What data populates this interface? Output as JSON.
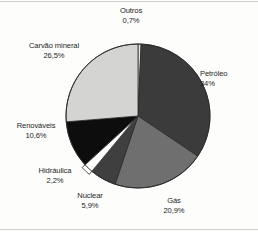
{
  "chart_data": {
    "type": "pie",
    "title": "",
    "subtitle": "",
    "xlabel": "",
    "ylabel": "",
    "legend_position": "none",
    "grid": false,
    "labels_show_percent": true,
    "start_angle_deg": 0,
    "direction": "clockwise",
    "categories": [
      "Outros",
      "Petróleo",
      "Gás",
      "Nuclear",
      "Hidráulica",
      "Renováveis",
      "Carvão mineral"
    ],
    "values": [
      0.7,
      34.0,
      20.9,
      5.9,
      2.2,
      10.6,
      26.5
    ],
    "value_labels": [
      "0,7%",
      "34%",
      "20,9%",
      "5,9%",
      "2,2%",
      "10,6%",
      "26,5%"
    ],
    "colors": [
      "#e8e8e6",
      "#3b3b3b",
      "#6f6f6f",
      "#3f3f3f",
      "#fdfdfc",
      "#0d0d0d",
      "#d4d4d2"
    ],
    "exploded": [
      false,
      false,
      false,
      false,
      true,
      false,
      false
    ],
    "slices": [
      {
        "name": "Outros",
        "value": 0.7,
        "value_label": "0,7%",
        "color": "#e8e8e6"
      },
      {
        "name": "Petróleo",
        "value": 34.0,
        "value_label": "34%",
        "color": "#3b3b3b"
      },
      {
        "name": "Gás",
        "value": 20.9,
        "value_label": "20,9%",
        "color": "#6f6f6f"
      },
      {
        "name": "Nuclear",
        "value": 5.9,
        "value_label": "5,9%",
        "color": "#3f3f3f"
      },
      {
        "name": "Hidráulica",
        "value": 2.2,
        "value_label": "2,2%",
        "color": "#fdfdfc"
      },
      {
        "name": "Renováveis",
        "value": 10.6,
        "value_label": "10,6%",
        "color": "#0d0d0d"
      },
      {
        "name": "Carvão mineral",
        "value": 26.5,
        "value_label": "26,5%",
        "color": "#d4d4d2"
      }
    ]
  },
  "labels": {
    "outros": {
      "name": "Outros",
      "value": "0,7%"
    },
    "petroleo": {
      "name": "Petróleo",
      "value": "34%"
    },
    "gas": {
      "name": "Gás",
      "value": "20,9%"
    },
    "nuclear": {
      "name": "Nuclear",
      "value": "5,9%"
    },
    "hidraulica": {
      "name": "Hidráulica",
      "value": "2,2%"
    },
    "renovaveis": {
      "name": "Renováveis",
      "value": "10,6%"
    },
    "carvao_mineral": {
      "name": "Carvão mineral",
      "value": "26,5%"
    }
  },
  "style": {
    "background": "#fdfdfc",
    "text_color": "#1d1d1d",
    "outline_color": "#2a2a2a"
  }
}
